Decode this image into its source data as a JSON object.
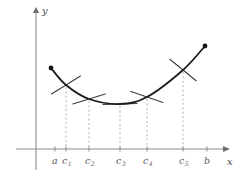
{
  "figure": {
    "title": "",
    "background_color": "#ffffff",
    "curve_color": "#1d1d1d",
    "tangent_color": "#3a3a3a",
    "dashed_color": "#b0b0b0",
    "axis_color": "#8c8c8c",
    "label_color": "#5a5a5a"
  },
  "axes": {
    "x_label": "x",
    "y_label": "y",
    "origin_px": {
      "x": 36,
      "y": 149
    },
    "x_axis_y_px": 149,
    "y_axis_x_px": 36,
    "x_axis_extent_px": {
      "start": 16,
      "end": 224
    },
    "y_axis_extent_px": {
      "start": 12,
      "end": 170
    }
  },
  "ticks": [
    {
      "name": "a",
      "base": "a",
      "sub": "",
      "x_px": 55,
      "label_x_px": 52,
      "label_y_px": 164,
      "has_dashed_line": false
    },
    {
      "name": "c1",
      "base": "c",
      "sub": "1",
      "x_px": 66,
      "label_x_px": 62,
      "label_y_px": 164,
      "has_dashed_line": true
    },
    {
      "name": "c2",
      "base": "c",
      "sub": "2",
      "x_px": 89,
      "label_x_px": 85,
      "label_y_px": 164,
      "has_dashed_line": true
    },
    {
      "name": "c3",
      "base": "c",
      "sub": "3",
      "x_px": 120,
      "label_x_px": 116,
      "label_y_px": 164,
      "has_dashed_line": true
    },
    {
      "name": "c4",
      "base": "c",
      "sub": "4",
      "x_px": 147,
      "label_x_px": 143,
      "label_y_px": 164,
      "has_dashed_line": true
    },
    {
      "name": "c5",
      "base": "c",
      "sub": "5",
      "x_px": 183,
      "label_x_px": 179,
      "label_y_px": 164,
      "has_dashed_line": true
    },
    {
      "name": "b",
      "base": "b",
      "sub": "",
      "x_px": 207,
      "label_x_px": 204,
      "label_y_px": 164,
      "has_dashed_line": false
    }
  ],
  "chart_data": {
    "type": "line",
    "title": "",
    "xlabel": "x",
    "ylabel": "y",
    "grid": false,
    "legend": null,
    "categories": [
      "a",
      "c1",
      "c2",
      "c3",
      "c4",
      "c5",
      "b"
    ],
    "curve_points_px": [
      {
        "x": 51,
        "y": 68
      },
      {
        "x": 66,
        "y": 85
      },
      {
        "x": 89,
        "y": 99
      },
      {
        "x": 120,
        "y": 104
      },
      {
        "x": 147,
        "y": 97
      },
      {
        "x": 183,
        "y": 70
      },
      {
        "x": 205,
        "y": 46
      }
    ],
    "tangents": [
      {
        "at": "c1",
        "x_px": 66,
        "y_px": 85,
        "half_len_px": 17,
        "slope": -0.62
      },
      {
        "at": "c2",
        "x_px": 89,
        "y_px": 99,
        "half_len_px": 17,
        "slope": -0.3
      },
      {
        "at": "c3",
        "x_px": 120,
        "y_px": 104,
        "half_len_px": 17,
        "slope": -0.03
      },
      {
        "at": "c4",
        "x_px": 147,
        "y_px": 97,
        "half_len_px": 17,
        "slope": 0.34
      },
      {
        "at": "c5",
        "x_px": 183,
        "y_px": 70,
        "half_len_px": 17,
        "slope": 0.82
      }
    ],
    "endpoints": [
      {
        "name": "a",
        "x_px": 51,
        "y_px": 68
      },
      {
        "name": "b",
        "x_px": 205,
        "y_px": 46
      }
    ]
  }
}
